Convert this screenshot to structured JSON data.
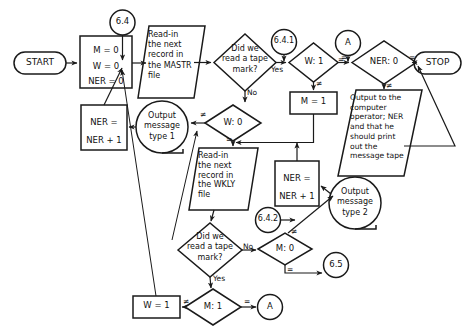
{
  "diagram": {
    "bg_color": "#ffffff",
    "stroke_color": "#1a1a1a",
    "text_color": "#111111"
  },
  "nodes": {
    "start": {
      "label": "START",
      "shape": "terminator"
    },
    "init": {
      "label": "M = 0\nW = 0\nNER = 0",
      "shape": "process"
    },
    "conn_6_4": {
      "label": "6.4",
      "shape": "connector"
    },
    "read_mastr": {
      "label": "Read-in\nthe next\nrecord in\nthe MASTR\nfile",
      "shape": "io-parallelogram"
    },
    "decide_tape_1": {
      "label": "Did we\nread a tape\nmark?",
      "shape": "decision"
    },
    "conn_6_4_1": {
      "label": "6.4.1",
      "shape": "connector"
    },
    "cmp_w_1": {
      "label": "W: 1",
      "shape": "decision"
    },
    "conn_a_top": {
      "label": "A",
      "shape": "connector"
    },
    "cmp_ner_0": {
      "label": "NER: 0",
      "shape": "decision"
    },
    "stop": {
      "label": "STOP",
      "shape": "terminator"
    },
    "set_m_1": {
      "label": "M = 1",
      "shape": "process"
    },
    "output_operator": {
      "label": "Output to the\ncomputer\noperator; NER\nand that he\nshould print\nout the\nmessage tape",
      "shape": "io-parallelogram"
    },
    "cmp_w_0": {
      "label": "W: 0",
      "shape": "decision"
    },
    "out_msg_1": {
      "label": "Output\nmessage\ntype 1",
      "shape": "document"
    },
    "ner_inc_1": {
      "label": "NER =\nNER + 1",
      "shape": "process"
    },
    "read_wkly": {
      "label": "Read-in\nthe next\nrecord in\nthe WKLY\nfile",
      "shape": "io-parallelogram"
    },
    "ner_inc_2": {
      "label": "NER =\nNER + 1",
      "shape": "process"
    },
    "out_msg_2": {
      "label": "Output\nmessage\ntype 2",
      "shape": "document"
    },
    "decide_tape_2": {
      "label": "Did we\nread a tape\nmark?",
      "shape": "decision"
    },
    "conn_6_4_2": {
      "label": "6.4.2",
      "shape": "connector"
    },
    "cmp_m_0": {
      "label": "M: 0",
      "shape": "decision"
    },
    "conn_6_5": {
      "label": "6.5",
      "shape": "connector"
    },
    "cmp_m_1": {
      "label": "M: 1",
      "shape": "decision"
    },
    "set_w_1": {
      "label": "W = 1",
      "shape": "process"
    },
    "conn_a_bottom": {
      "label": "A",
      "shape": "connector"
    }
  },
  "edge_labels": {
    "tape1_yes": "Yes",
    "tape1_no": "No",
    "w1_eq": "=",
    "w1_ne": "≠",
    "a_top_eq": "=",
    "ner0_eq": "=",
    "ner0_ne": "≠",
    "w0_ne": "≠",
    "w0_eq": "=",
    "tape2_no": "No",
    "tape2_yes": "Yes",
    "m0_ne": "≠",
    "m0_eq": "=",
    "m1_ne": "≠",
    "m1_eq": "="
  }
}
